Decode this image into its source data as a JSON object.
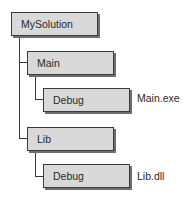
{
  "diagram": {
    "type": "folder-tree",
    "nodes": [
      {
        "id": "root",
        "label": "MySolution",
        "parent": null
      },
      {
        "id": "main",
        "label": "Main",
        "parent": "root"
      },
      {
        "id": "main-debug",
        "label": "Debug",
        "parent": "main",
        "output": "Main.exe"
      },
      {
        "id": "lib",
        "label": "Lib",
        "parent": "root"
      },
      {
        "id": "lib-debug",
        "label": "Debug",
        "parent": "lib",
        "output": "Lib.dll"
      }
    ],
    "colors": {
      "box_fill": "#d9d9d9",
      "box_border": "#3a3a3a",
      "connector": "#3a3a3a",
      "text": "#2a2a2a"
    }
  }
}
